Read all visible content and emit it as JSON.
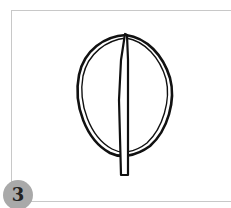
{
  "figure": {
    "step_number": "3",
    "illustration": "leaf-outline-icon",
    "colors": {
      "stroke": "#111111",
      "frame_border": "#c8c8c8",
      "badge_fill": "#a9a9a9",
      "badge_text": "#222222"
    }
  }
}
